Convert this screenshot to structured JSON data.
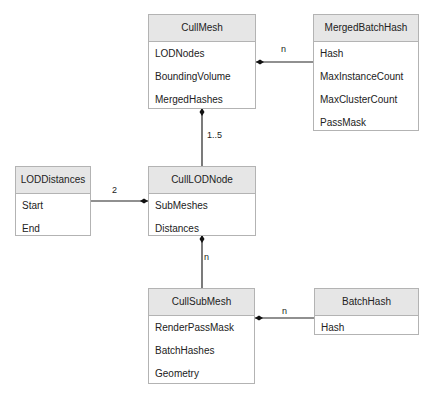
{
  "diagram": {
    "type": "uml-class",
    "classes": [
      {
        "name": "CullMesh",
        "attributes": [
          "LODNodes",
          "BoundingVolume",
          "MergedHashes"
        ]
      },
      {
        "name": "MergedBatchHash",
        "attributes": [
          "Hash",
          "MaxInstanceCount",
          "MaxClusterCount",
          "PassMask"
        ]
      },
      {
        "name": "LODDistances",
        "attributes": [
          "Start",
          "End"
        ]
      },
      {
        "name": "CullLODNode",
        "attributes": [
          "SubMeshes",
          "Distances"
        ]
      },
      {
        "name": "CullSubMesh",
        "attributes": [
          "RenderPassMask",
          "BatchHashes",
          "Geometry"
        ]
      },
      {
        "name": "BatchHash",
        "attributes": [
          "Hash"
        ]
      }
    ],
    "associations": [
      {
        "from": "CullMesh",
        "to": "MergedBatchHash",
        "kind": "composition",
        "multiplicity": "n"
      },
      {
        "from": "CullMesh",
        "to": "CullLODNode",
        "kind": "composition",
        "multiplicity": "1..5"
      },
      {
        "from": "CullLODNode",
        "to": "LODDistances",
        "kind": "composition",
        "multiplicity": "2"
      },
      {
        "from": "CullLODNode",
        "to": "CullSubMesh",
        "kind": "composition",
        "multiplicity": "n"
      },
      {
        "from": "CullSubMesh",
        "to": "BatchHash",
        "kind": "composition",
        "multiplicity": "n"
      }
    ]
  }
}
